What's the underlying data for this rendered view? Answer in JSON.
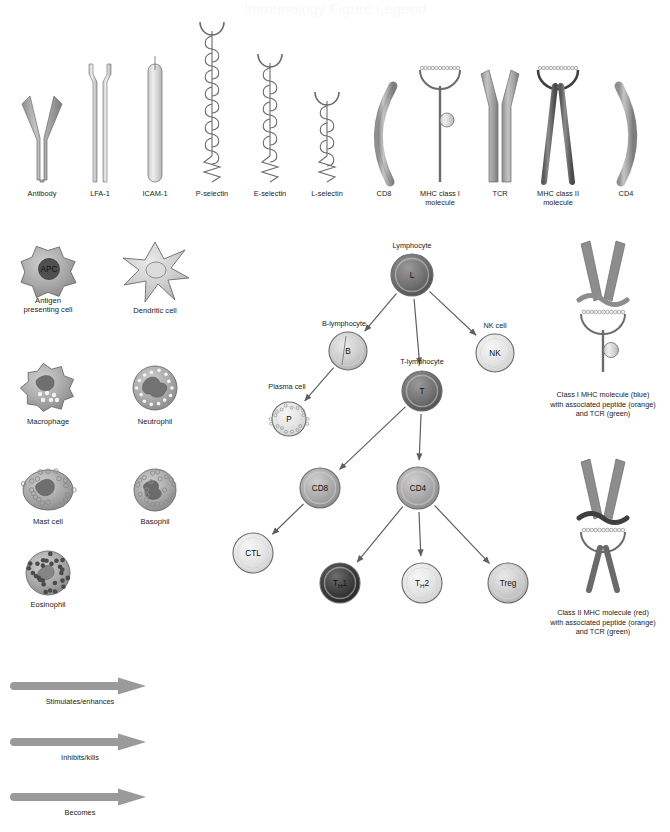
{
  "page": {
    "title_partial": "Immunology Figure Legend",
    "background": "#ffffff"
  },
  "colors": {
    "light_gray": "#d6d6d6",
    "mid_gray": "#a8a8a8",
    "dark_gray": "#6e6e6e",
    "very_dark": "#3a3a3a",
    "outline": "#6b6b6b",
    "arrow": "#5f5f5f",
    "text": "#222222"
  },
  "molecules": {
    "section_name": "molecule-key-row",
    "items": [
      {
        "id": "antibody",
        "label": "Antibody",
        "shape": "y-shape",
        "tone": "mid",
        "cx": 42,
        "label_y": 196
      },
      {
        "id": "lfa1",
        "label": "LFA-1",
        "shape": "twin-stalk",
        "tone": "light",
        "cx": 100,
        "label_y": 196
      },
      {
        "id": "icam1",
        "label": "ICAM-1",
        "shape": "rod",
        "tone": "light",
        "cx": 155,
        "label_y": 196
      },
      {
        "id": "p-selectin",
        "label": "P-selectin",
        "shape": "selectin-long",
        "tone": "light",
        "cx": 212,
        "label_y": 196
      },
      {
        "id": "e-selectin",
        "label": "E-selectin",
        "shape": "selectin-med",
        "tone": "light",
        "cx": 270,
        "label_y": 196
      },
      {
        "id": "l-selectin",
        "label": "L-selectin",
        "shape": "selectin-short",
        "tone": "light",
        "cx": 327,
        "label_y": 196
      },
      {
        "id": "cd8",
        "label": "CD8",
        "shape": "arc-left",
        "tone": "mid",
        "cx": 384,
        "label_y": 196
      },
      {
        "id": "mhc1",
        "label": "MHC class I molecule",
        "shape": "mhc-class-1",
        "tone": "light",
        "cx": 440,
        "label_y": 196,
        "label_lines": [
          "MHC class I",
          "molecule"
        ]
      },
      {
        "id": "tcr",
        "label": "TCR",
        "shape": "tcr",
        "tone": "mid",
        "cx": 500,
        "label_y": 196
      },
      {
        "id": "mhc2",
        "label": "MHC class II molecule",
        "shape": "mhc-class-2",
        "tone": "dark",
        "cx": 558,
        "label_y": 196,
        "label_lines": [
          "MHC class II",
          "molecule"
        ]
      },
      {
        "id": "cd4",
        "label": "CD4",
        "shape": "arc-right",
        "tone": "mid",
        "cx": 626,
        "label_y": 196
      }
    ]
  },
  "cells": {
    "section_name": "cell-type-key",
    "items": [
      {
        "id": "apc",
        "label_lines": [
          "Antigen",
          "presenting cell"
        ],
        "inner_text": "APC",
        "cx": 48,
        "cy": 272,
        "label_y": 303,
        "type": "blob-nucleus"
      },
      {
        "id": "dendritic",
        "label_lines": [
          "Dendritic cell"
        ],
        "inner_text": "",
        "cx": 155,
        "cy": 272,
        "label_y": 313,
        "type": "dendritic"
      },
      {
        "id": "macrophage",
        "label_lines": [
          "Macrophage"
        ],
        "inner_text": "",
        "cx": 48,
        "cy": 388,
        "label_y": 424,
        "type": "macrophage"
      },
      {
        "id": "neutrophil",
        "label_lines": [
          "Neutrophil"
        ],
        "inner_text": "",
        "cx": 155,
        "cy": 388,
        "label_y": 424,
        "type": "neutrophil"
      },
      {
        "id": "mastcell",
        "label_lines": [
          "Mast cell"
        ],
        "inner_text": "",
        "cx": 48,
        "cy": 490,
        "label_y": 524,
        "type": "mast"
      },
      {
        "id": "basophil",
        "label_lines": [
          "Basophil"
        ],
        "inner_text": "",
        "cx": 155,
        "cy": 490,
        "label_y": 524,
        "type": "basophil"
      },
      {
        "id": "eosinophil",
        "label_lines": [
          "Eosinophil"
        ],
        "inner_text": "",
        "cx": 48,
        "cy": 573,
        "label_y": 607,
        "type": "eosinophil"
      }
    ]
  },
  "lineage": {
    "section_name": "lymphocyte-lineage-tree",
    "nodes": [
      {
        "id": "lymphocyte",
        "text": "L",
        "label": "Lymphocyte",
        "cx": 412,
        "cy": 275,
        "r": 21,
        "tone": "dark",
        "label_dx": 0,
        "label_dy": -27
      },
      {
        "id": "b-lymphocyte",
        "text": "B",
        "label": "B-lymphocyte",
        "cx": 348,
        "cy": 351,
        "r": 19,
        "tone": "light",
        "label_dx": -4,
        "label_dy": -25
      },
      {
        "id": "nk-cell",
        "text": "NK",
        "label": "NK cell",
        "cx": 495,
        "cy": 353,
        "r": 19,
        "tone": "verylight",
        "label_dx": 0,
        "label_dy": -25
      },
      {
        "id": "plasma-cell",
        "text": "P",
        "label": "Plasma cell",
        "cx": 289,
        "cy": 419,
        "r": 17,
        "tone": "verylight",
        "label_dx": -2,
        "label_dy": -30
      },
      {
        "id": "t-lymphocyte",
        "text": "T",
        "label": "T-lymphocyte",
        "cx": 422,
        "cy": 391,
        "r": 20,
        "tone": "dark",
        "label_dx": 0,
        "label_dy": -27
      },
      {
        "id": "cd8-cell",
        "text": "CD8",
        "label": "",
        "cx": 320,
        "cy": 488,
        "r": 20,
        "tone": "mid",
        "label_dx": 0,
        "label_dy": 0
      },
      {
        "id": "cd4-cell",
        "text": "CD4",
        "label": "",
        "cx": 418,
        "cy": 488,
        "r": 21,
        "tone": "mid",
        "label_dx": 0,
        "label_dy": 0
      },
      {
        "id": "ctl-cell",
        "text": "CTL",
        "label": "",
        "cx": 253,
        "cy": 553,
        "r": 20,
        "tone": "verylight",
        "label_dx": 0,
        "label_dy": 0
      },
      {
        "id": "th1-cell",
        "text": "T|H|1",
        "label": "",
        "cx": 340,
        "cy": 583,
        "r": 20,
        "tone": "verydark",
        "label_dx": 0,
        "label_dy": 0
      },
      {
        "id": "th2-cell",
        "text": "T|H|2",
        "label": "",
        "cx": 422,
        "cy": 583,
        "r": 20,
        "tone": "verylight",
        "label_dx": 0,
        "label_dy": 0
      },
      {
        "id": "treg-cell",
        "text": "Treg",
        "label": "",
        "cx": 508,
        "cy": 583,
        "r": 20,
        "tone": "light",
        "label_dx": 0,
        "label_dy": 0
      }
    ],
    "edges": [
      {
        "from": "lymphocyte",
        "to": "b-lymphocyte"
      },
      {
        "from": "lymphocyte",
        "to": "t-lymphocyte"
      },
      {
        "from": "lymphocyte",
        "to": "nk-cell"
      },
      {
        "from": "b-lymphocyte",
        "to": "plasma-cell"
      },
      {
        "from": "t-lymphocyte",
        "to": "cd8-cell"
      },
      {
        "from": "t-lymphocyte",
        "to": "cd4-cell"
      },
      {
        "from": "cd8-cell",
        "to": "ctl-cell"
      },
      {
        "from": "cd4-cell",
        "to": "th1-cell"
      },
      {
        "from": "cd4-cell",
        "to": "th2-cell"
      },
      {
        "from": "cd4-cell",
        "to": "treg-cell"
      }
    ]
  },
  "complexes": [
    {
      "id": "mhc-class-1-complex",
      "cx": 603,
      "cy": 310,
      "caption_lines": [
        "Class I MHC molecule (blue)",
        "with associated peptide (orange)",
        "and TCR (green)"
      ],
      "caption_y": 397,
      "mhc_tone": "mid"
    },
    {
      "id": "mhc-class-2-complex",
      "cx": 603,
      "cy": 528,
      "caption_lines": [
        "Class II MHC molecule (red)",
        "with associated peptide (orange)",
        "and TCR (green)"
      ],
      "caption_y": 615,
      "mhc_tone": "dark"
    }
  ],
  "legend": {
    "section_name": "arrow-legend",
    "items": [
      {
        "id": "stimulates",
        "label": "Stimulates/enhances",
        "y": 686,
        "x1": 14,
        "x2": 118,
        "label_y": 704
      },
      {
        "id": "inhibits",
        "label": "Inhibits/kills",
        "y": 742,
        "x1": 14,
        "x2": 118,
        "label_y": 760
      },
      {
        "id": "becomes",
        "label": "Becomes",
        "y": 797,
        "x1": 14,
        "x2": 118,
        "label_y": 815
      }
    ]
  }
}
